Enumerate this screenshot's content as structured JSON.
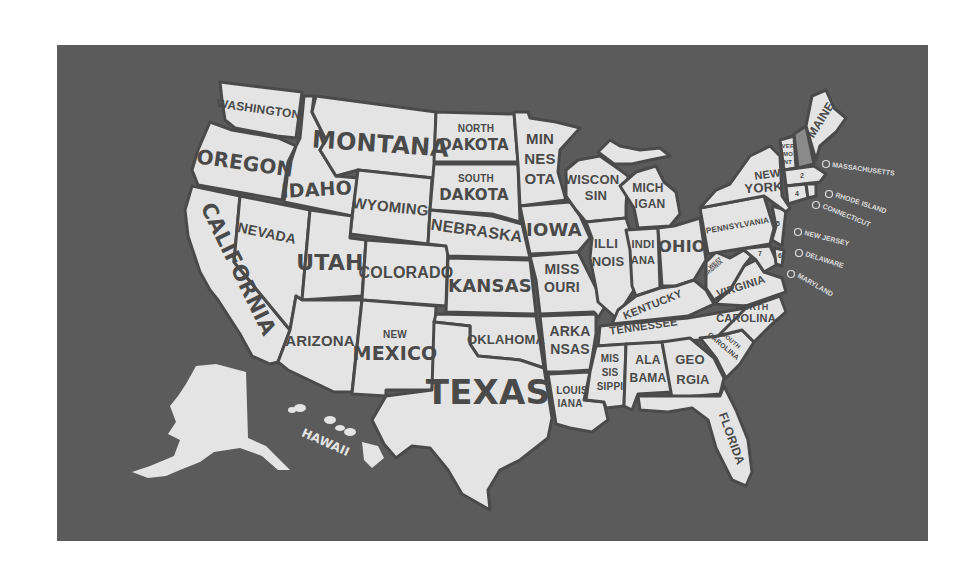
{
  "map": {
    "title": "United States Map",
    "colors": {
      "background": "#5b5b5b",
      "land": "#e4e4e4",
      "border": "#4a4a4a",
      "highlight": "#8a8a8a"
    },
    "states": {
      "washington": [
        "WASHINGTON"
      ],
      "oregon": [
        "OREGON"
      ],
      "california": [
        "CALIFORNIA"
      ],
      "nevada": [
        "NEVADA"
      ],
      "idaho": [
        "IDAHO"
      ],
      "montana": [
        "MONTANA"
      ],
      "wyoming": [
        "WYOMING"
      ],
      "utah": [
        "UTAH"
      ],
      "arizona": [
        "ARIZONA"
      ],
      "colorado": [
        "COLORADO"
      ],
      "new_mexico": [
        "NEW",
        "MEXICO"
      ],
      "north_dakota": [
        "NORTH",
        "DAKOTA"
      ],
      "south_dakota": [
        "SOUTH",
        "DAKOTA"
      ],
      "nebraska": [
        "NEBRASKA"
      ],
      "kansas": [
        "KANSAS"
      ],
      "oklahoma": [
        "OKLAHOMA"
      ],
      "texas": [
        "TEXAS"
      ],
      "minnesota": [
        "MIN",
        "NES",
        "OTA"
      ],
      "iowa": [
        "IOWA"
      ],
      "missouri": [
        "MISS",
        "OURI"
      ],
      "arkansas": [
        "ARKA",
        "NSAS"
      ],
      "louisiana": [
        "LOUIS",
        "IANA"
      ],
      "wisconsin": [
        "WISCON",
        "SIN"
      ],
      "illinois": [
        "ILLI",
        "NOIS"
      ],
      "michigan": [
        "MICH",
        "IGAN"
      ],
      "indiana": [
        "INDI",
        "ANA"
      ],
      "ohio": [
        "OHIO"
      ],
      "kentucky": [
        "KENTUCKY"
      ],
      "tennessee": [
        "TENNESSEE"
      ],
      "mississippi": [
        "MIS",
        "SIS",
        "SIPPI"
      ],
      "alabama": [
        "ALA",
        "BAMA"
      ],
      "georgia": [
        "GEO",
        "RGIA"
      ],
      "florida": [
        "FLORIDA"
      ],
      "south_carolina": [
        "SOUTH",
        "CAROLINA"
      ],
      "north_carolina": [
        "NORTH",
        "CAROLINA"
      ],
      "virginia": [
        "VIRGINIA"
      ],
      "west_virginia": [
        "WEST",
        "VIRGINIA"
      ],
      "pennsylvania": [
        "PENNSYLVANIA"
      ],
      "new_york": [
        "NEW",
        "YORK"
      ],
      "vermont": [
        "VER",
        "MO",
        "NT"
      ],
      "new_hampshire": [
        "NEW HAMPSHIRE"
      ],
      "maine": [
        "MAINE"
      ],
      "alaska": [
        "ALASKA"
      ],
      "hawaii": [
        "HAWAII"
      ]
    },
    "callouts": [
      {
        "number": "2",
        "label": "MASSACHUSETTS"
      },
      {
        "number": "3",
        "label": "RHODE ISLAND"
      },
      {
        "number": "4",
        "label": "CONNECTICUT"
      },
      {
        "number": "5",
        "label": "NEW JERSEY"
      },
      {
        "number": "6",
        "label": "DELAWARE"
      },
      {
        "number": "7",
        "label": "MARYLAND"
      }
    ],
    "inline_numbers": [
      "2",
      "4",
      "5",
      "6",
      "7",
      "8"
    ]
  }
}
